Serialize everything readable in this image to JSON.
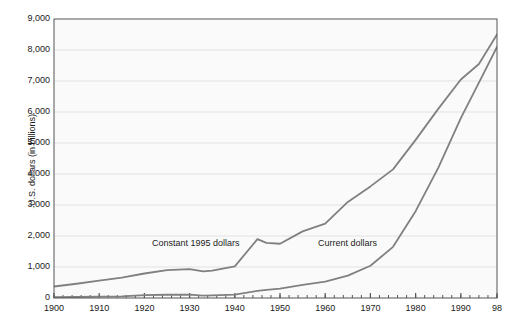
{
  "top_caption": "",
  "chart_data": {
    "type": "line",
    "title": "",
    "xlabel": "",
    "ylabel": "U.S. dollars (in billions)",
    "xlim": [
      1900,
      1998
    ],
    "ylim": [
      0,
      9000
    ],
    "grid": true,
    "legend_position": "inline-annotation",
    "y_ticks": [
      "0",
      "1,000",
      "2,000",
      "3,000",
      "4,000",
      "5,000",
      "6,000",
      "7,000",
      "8,000",
      "9,000"
    ],
    "y_tick_values": [
      0,
      1000,
      2000,
      3000,
      4000,
      5000,
      6000,
      7000,
      8000,
      9000
    ],
    "x_ticks": [
      "1900",
      "1910",
      "1920",
      "1930",
      "1940",
      "1950",
      "1960",
      "1970",
      "1980",
      "1990",
      "98"
    ],
    "x_tick_values": [
      1900,
      1910,
      1920,
      1930,
      1940,
      1950,
      1960,
      1970,
      1980,
      1990,
      1998
    ],
    "minor_tick_interval": 2,
    "line_color": "#808080",
    "plot_background": "#fafafa",
    "grid_color": "#e2e2e2",
    "axis_color": "#555555",
    "x": [
      1900,
      1905,
      1910,
      1915,
      1920,
      1925,
      1930,
      1933,
      1935,
      1940,
      1945,
      1947,
      1950,
      1955,
      1960,
      1965,
      1970,
      1975,
      1980,
      1985,
      1990,
      1994,
      1998
    ],
    "series": [
      {
        "name": "Constant 1995 dollars",
        "values": [
          370,
          460,
          560,
          660,
          790,
          900,
          930,
          860,
          880,
          1020,
          1900,
          1780,
          1750,
          2150,
          2400,
          3100,
          3600,
          4150,
          5100,
          6100,
          7050,
          7550,
          8500
        ]
      },
      {
        "name": "Current dollars",
        "values": [
          25,
          32,
          42,
          52,
          95,
          105,
          110,
          75,
          82,
          110,
          230,
          260,
          300,
          420,
          530,
          720,
          1040,
          1650,
          2800,
          4200,
          5800,
          6950,
          8100
        ]
      }
    ],
    "annotations": [
      {
        "text": "Constant 1995 dollars",
        "x": 1930,
        "y": 2050
      },
      {
        "text": "Current dollars",
        "x": 1964,
        "y": 2050
      }
    ]
  }
}
